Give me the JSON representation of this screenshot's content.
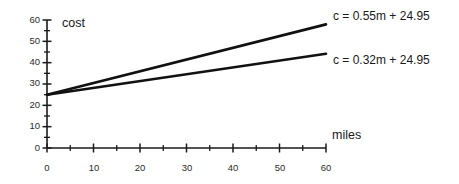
{
  "chart_data": {
    "type": "line",
    "title": "",
    "xlabel": "miles",
    "ylabel": "cost",
    "xlim": [
      0,
      60
    ],
    "ylim": [
      0,
      60
    ],
    "xticks": [
      0,
      10,
      20,
      30,
      40,
      50,
      60
    ],
    "yticks": [
      0,
      10,
      20,
      30,
      40,
      50,
      60
    ],
    "xtick_labels": [
      "0",
      "10",
      "20",
      "30",
      "40",
      "50",
      "60"
    ],
    "ytick_labels": [
      "0",
      "10",
      "20",
      "30",
      "40",
      "50",
      "60"
    ],
    "minor_tick_step": 5,
    "grid": false,
    "legend_position": "right-inline",
    "x": [
      0,
      60
    ],
    "series": [
      {
        "name": "c = 0.55m + 24.95",
        "slope": 0.55,
        "intercept": 24.95,
        "values": [
          24.95,
          57.95
        ],
        "color": "#111111"
      },
      {
        "name": "c = 0.32m + 24.95",
        "slope": 0.32,
        "intercept": 24.95,
        "values": [
          24.95,
          44.15
        ],
        "color": "#111111"
      }
    ],
    "annotations": [
      {
        "text": "c = 0.55m + 24.95",
        "target_series": 0
      },
      {
        "text": "c = 0.32m + 24.95",
        "target_series": 1
      }
    ]
  },
  "axes": {
    "y_title": "cost",
    "x_title": "miles"
  },
  "labels": {
    "series_upper": "c = 0.55m + 24.95",
    "series_lower": "c = 0.32m + 24.95"
  },
  "ytick_0": "0",
  "ytick_1": "10",
  "ytick_2": "20",
  "ytick_3": "30",
  "ytick_4": "40",
  "ytick_5": "50",
  "ytick_6": "60",
  "xtick_0": "0",
  "xtick_1": "10",
  "xtick_2": "20",
  "xtick_3": "30",
  "xtick_4": "40",
  "xtick_5": "50",
  "xtick_6": "60"
}
